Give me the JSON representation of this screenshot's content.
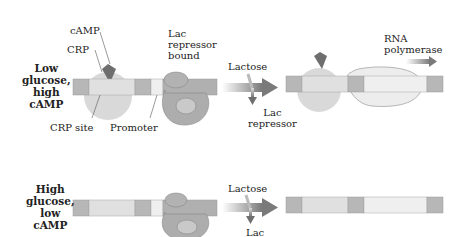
{
  "top_panel": {
    "condition": [
      "Low",
      "glucose,",
      "high",
      "cAMP"
    ],
    "labels": {
      "camp": "cAMP",
      "crp": "CRP",
      "lac_repressor_bound": [
        "Lac",
        "repressor",
        "bound"
      ],
      "crp_site": "CRP site",
      "promoter": "Promoter",
      "lactose": "Lactose",
      "lac_repressor": [
        "Lac",
        "repressor"
      ],
      "rna_polymerase": [
        "RNA",
        "polymerase"
      ]
    }
  },
  "bottom_panel": {
    "condition": [
      "High",
      "glucose,",
      "low",
      "cAMP"
    ],
    "labels": {
      "lactose": "Lactose",
      "lac": "Lac"
    }
  },
  "colors": {
    "dna_dark": "#b5b5b5",
    "dna_light": "#dedede",
    "dna_lighter": "#ececec",
    "crp": "#d7d7d7",
    "camp": "#6e6e6e",
    "repressor": "#a9a9a9",
    "polymerase": "#ececec",
    "arrow": "#8a8a8a"
  }
}
